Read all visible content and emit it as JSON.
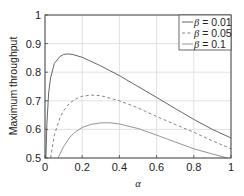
{
  "chart_data": {
    "type": "line",
    "title": "",
    "xlabel": "α",
    "ylabel": "Maximum throughput",
    "xlim": [
      0,
      1
    ],
    "ylim": [
      0.5,
      1
    ],
    "xticks": [
      0,
      0.2,
      0.4,
      0.6,
      0.8,
      1
    ],
    "xtick_labels": [
      "0",
      "0.2",
      "0.4",
      "0.6",
      "0.8",
      "1"
    ],
    "yticks": [
      0.5,
      0.6,
      0.7,
      0.8,
      0.9,
      1
    ],
    "ytick_labels": [
      "0.5",
      "0.6",
      "0.7",
      "0.8",
      "0.9",
      "1"
    ],
    "grid": true,
    "legend_position": "upper right",
    "series": [
      {
        "name": "β = 0.01",
        "style": "solid",
        "color": "#555555",
        "x": [
          0.005,
          0.01,
          0.02,
          0.03,
          0.05,
          0.08,
          0.1,
          0.12,
          0.15,
          0.2,
          0.3,
          0.4,
          0.5,
          0.6,
          0.7,
          0.8,
          0.9,
          1.0
        ],
        "y": [
          0.5,
          0.62,
          0.73,
          0.78,
          0.83,
          0.855,
          0.862,
          0.864,
          0.862,
          0.852,
          0.822,
          0.788,
          0.75,
          0.712,
          0.673,
          0.635,
          0.6,
          0.57
        ]
      },
      {
        "name": "β = 0.05",
        "style": "dashed",
        "color": "#777777",
        "x": [
          0.03,
          0.05,
          0.08,
          0.1,
          0.13,
          0.16,
          0.2,
          0.25,
          0.3,
          0.4,
          0.5,
          0.6,
          0.7,
          0.8,
          0.9,
          1.0
        ],
        "y": [
          0.5,
          0.58,
          0.64,
          0.665,
          0.69,
          0.705,
          0.716,
          0.72,
          0.718,
          0.7,
          0.675,
          0.645,
          0.617,
          0.59,
          0.56,
          0.532
        ]
      },
      {
        "name": "β = 0.1",
        "style": "solid",
        "color": "#888888",
        "x": [
          0.07,
          0.1,
          0.13,
          0.16,
          0.2,
          0.25,
          0.3,
          0.35,
          0.4,
          0.5,
          0.6,
          0.7,
          0.8,
          0.9,
          0.98
        ],
        "y": [
          0.5,
          0.54,
          0.57,
          0.59,
          0.607,
          0.618,
          0.623,
          0.623,
          0.619,
          0.603,
          0.58,
          0.556,
          0.532,
          0.514,
          0.5
        ]
      }
    ]
  },
  "legend": {
    "items": [
      {
        "symbol": "β",
        "text": " = 0.01"
      },
      {
        "symbol": "β",
        "text": " = 0.05"
      },
      {
        "symbol": "β",
        "text": " = 0.1"
      }
    ]
  },
  "colors": {
    "axes": "#444444",
    "grid": "#d9d9d9",
    "background": "#ffffff"
  }
}
